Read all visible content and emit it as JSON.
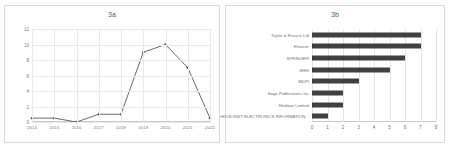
{
  "figure": {
    "panel_a_title": "3a",
    "panel_b_title": "3b"
  },
  "chart_data": [
    {
      "type": "line",
      "title": "3a",
      "xlabel": "",
      "ylabel": "",
      "categories": [
        "2014",
        "2015",
        "2016",
        "2017",
        "2018",
        "2019",
        "2020",
        "2021",
        "2022"
      ],
      "values": [
        0.5,
        0.5,
        0,
        1,
        1,
        9,
        10,
        7,
        0.5
      ],
      "ylim": [
        0,
        12
      ],
      "yticks": [
        "0",
        "1",
        "4",
        "6",
        "8",
        "10",
        "12"
      ],
      "ytick_values": [
        0,
        2,
        4,
        6,
        8,
        10,
        12
      ],
      "grid": true,
      "legend": "none",
      "series_color": "#595959",
      "marker": "diamond"
    },
    {
      "type": "bar",
      "orientation": "horizontal",
      "title": "3b",
      "xlabel": "",
      "ylabel": "",
      "categories": [
        "Taylor & Francis Ltd",
        "Elsevier",
        "SPRINGER",
        "IEEE",
        "MDPI",
        "Sage Publications Inc",
        "Hindawi Limited",
        "IEICE-INST ELECTRONICS INFORMATION..."
      ],
      "values": [
        7,
        7,
        6,
        5,
        3,
        2,
        2,
        1
      ],
      "xlim": [
        0,
        8
      ],
      "xticks": [
        "0",
        "1",
        "2",
        "3",
        "4",
        "5",
        "6",
        "7",
        "8"
      ],
      "grid": true,
      "legend": "none",
      "bar_color": "#404040"
    }
  ]
}
